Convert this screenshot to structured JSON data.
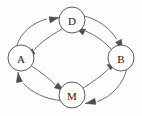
{
  "diagram": {
    "type": "directed-graph",
    "canvas": {
      "width": 142,
      "height": 116,
      "background": "#fdfdfd"
    },
    "style": {
      "node_fill": "#fdfdfd",
      "node_stroke": "#4a4a4a",
      "edge_stroke": "#5a5a5a",
      "label_color": "#1a1a1a",
      "node_radius": 13
    },
    "nodes": [
      {
        "id": "D",
        "label": "D",
        "cx": 72,
        "cy": 20,
        "r": 13
      },
      {
        "id": "A",
        "label": "A",
        "cx": 21,
        "cy": 58,
        "r": 13
      },
      {
        "id": "B",
        "label": "B",
        "cx": 121,
        "cy": 58,
        "r": 13
      },
      {
        "id": "M",
        "label": "M",
        "cx": 72,
        "cy": 95,
        "r": 13
      }
    ],
    "edges": [
      {
        "id": "A-to-D",
        "from": "A",
        "to": "D",
        "directed": true,
        "curve": "outer"
      },
      {
        "id": "D-to-A",
        "from": "D",
        "to": "A",
        "directed": true,
        "curve": "inner"
      },
      {
        "id": "D-to-B",
        "from": "D",
        "to": "B",
        "directed": true,
        "curve": "outer"
      },
      {
        "id": "B-to-D",
        "from": "B",
        "to": "D",
        "directed": true,
        "curve": "inner"
      },
      {
        "id": "A-to-M",
        "from": "A",
        "to": "M",
        "directed": true,
        "curve": "inner"
      },
      {
        "id": "M-to-A",
        "from": "M",
        "to": "A",
        "directed": true,
        "curve": "outer"
      },
      {
        "id": "M-to-B",
        "from": "M",
        "to": "B",
        "directed": true,
        "curve": "inner"
      },
      {
        "id": "B-to-M",
        "from": "B",
        "to": "M",
        "directed": true,
        "curve": "outer"
      }
    ]
  }
}
